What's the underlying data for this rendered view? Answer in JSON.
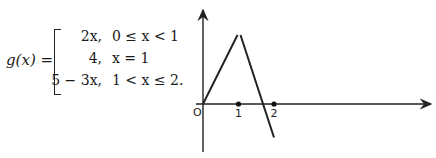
{
  "formula": {
    "lhs": "g(x)",
    "equals": "=",
    "cases": [
      {
        "value": "2x,",
        "condition": "0 ≤ x < 1"
      },
      {
        "value": "4,",
        "condition": "x = 1"
      },
      {
        "value": "5 − 3x,",
        "condition": "1 < x ≤ 2."
      }
    ]
  },
  "graph": {
    "origin_label": "O",
    "x_tick_labels": [
      "1",
      "2"
    ],
    "pieces": [
      {
        "name": "left-segment",
        "from": [
          0,
          0
        ],
        "to": [
          1,
          2
        ]
      },
      {
        "name": "right-segment",
        "from": [
          1,
          2
        ],
        "to": [
          2,
          -1
        ]
      }
    ],
    "marked_points": [
      1,
      2
    ]
  }
}
